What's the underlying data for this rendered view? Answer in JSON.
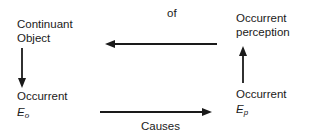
{
  "nodes": {
    "continuant_object": {
      "line1": "Continuant",
      "line2": "Object"
    },
    "occurrent_perception": {
      "line1": "Occurrent",
      "line2": "perception"
    },
    "occurrent_eo": {
      "line1": "Occurrent",
      "symbol": "E",
      "subscript": "o"
    },
    "occurrent_ep": {
      "line1": "Occurrent",
      "symbol": "E",
      "subscript": "p"
    }
  },
  "edges": {
    "top": {
      "label": "of",
      "from": "occurrent_perception",
      "to": "continuant_object"
    },
    "bottom": {
      "label": "Causes",
      "from": "occurrent_eo",
      "to": "occurrent_ep"
    },
    "left": {
      "label": "",
      "from": "continuant_object",
      "to": "occurrent_eo"
    },
    "right": {
      "label": "",
      "from": "occurrent_ep",
      "to": "occurrent_perception"
    }
  },
  "colors": {
    "stroke": "#1a1a1a",
    "background": "#ffffff"
  }
}
